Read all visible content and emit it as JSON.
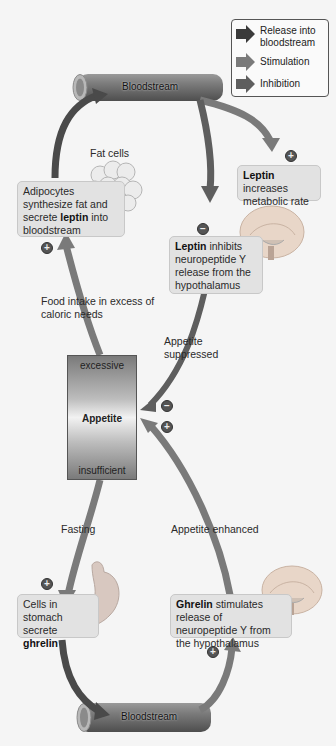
{
  "legend": {
    "items": [
      {
        "label": "Release into bloodstream",
        "color": "#3a3a3a",
        "icon": "arrow-right-icon"
      },
      {
        "label": "Stimulation",
        "color": "#7a7a7a",
        "icon": "arrow-right-icon"
      },
      {
        "label": "Inhibition",
        "color": "#5e5e5e",
        "icon": "arrow-right-icon"
      }
    ]
  },
  "vessels": {
    "top": "Bloodstream",
    "bottom": "Bloodstream"
  },
  "labels": {
    "fat_cells": "Fat cells",
    "food_intake": "Food intake in excess of caloric needs",
    "appetite_suppressed": "Appetite suppressed",
    "fasting": "Fasting",
    "appetite_enhanced": "Appetite enhanced"
  },
  "boxes": {
    "adipocytes": {
      "pre": "Adipocytes synthesize fat and secrete ",
      "bold": "leptin",
      "post": " into bloodstream"
    },
    "leptin_metabolic": {
      "bold": "Leptin",
      "post": " increases metabolic rate"
    },
    "leptin_inhibits": {
      "bold": "Leptin",
      "post": " inhibits neuropeptide Y release from the hypothalamus"
    },
    "stomach": {
      "pre": "Cells in stomach secrete ",
      "bold": "ghrelin"
    },
    "ghrelin_stimulates": {
      "bold": "Ghrelin",
      "post": " stimulates release of neuropeptide Y from the hypothalamus"
    }
  },
  "appetite": {
    "top": "excessive",
    "center": "Appetite",
    "bottom": "insufficient"
  },
  "signs": {
    "plus": "+",
    "minus": "−"
  },
  "colors": {
    "release_arrow": "#3a3a3a",
    "stimulation_arrow": "#7a7a7a",
    "inhibition_arrow": "#5e5e5e",
    "box_fill": "#e2e2e2",
    "vessel": "#777777"
  }
}
